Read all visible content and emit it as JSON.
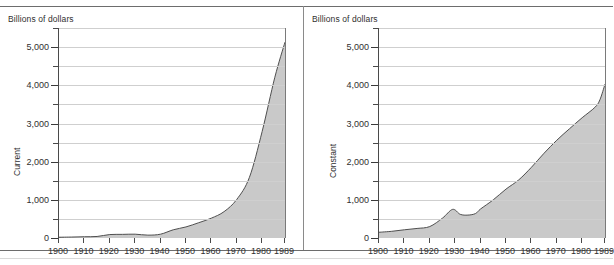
{
  "figure": {
    "unit_label": "Billions of dollars",
    "fill_color": "#c9c9c9",
    "stroke_color": "#4f4f4f",
    "grid_color": "#cfcfcf",
    "axis_color": "#4a4a4a"
  },
  "panels": [
    {
      "id": "left",
      "series_label": "Current"
    },
    {
      "id": "right",
      "series_label": "Constant"
    }
  ],
  "axis": {
    "y_labels": [
      "5,000",
      "4,000",
      "3,000",
      "2,000",
      "1,000",
      "0"
    ],
    "y_values": [
      5000,
      4000,
      3000,
      2000,
      1000,
      0
    ],
    "y_minor_values": [
      5500,
      4500,
      3500,
      2500,
      1500,
      500
    ],
    "x_labels": [
      "1900",
      "1910",
      "1920",
      "1930",
      "1940",
      "1950",
      "1960",
      "1970",
      "1980",
      "1989"
    ],
    "x_values": [
      1900,
      1910,
      1920,
      1930,
      1940,
      1950,
      1960,
      1970,
      1980,
      1989
    ]
  },
  "chart_data": [
    {
      "type": "area",
      "title": "",
      "subtitle": "",
      "panel": "Current",
      "xlabel": "",
      "ylabel": "Billions of dollars",
      "series_name": "Current",
      "xlim": [
        1900,
        1989
      ],
      "ylim": [
        0,
        5500
      ],
      "yticks": [
        0,
        1000,
        2000,
        3000,
        4000,
        5000
      ],
      "yticklabels": [
        "0",
        "1,000",
        "2,000",
        "3,000",
        "4,000",
        "5,000"
      ],
      "xticks": [
        1900,
        1910,
        1920,
        1930,
        1940,
        1950,
        1960,
        1970,
        1980,
        1989
      ],
      "grid": "horizontal",
      "legend": "none",
      "x": [
        1900,
        1905,
        1910,
        1915,
        1920,
        1925,
        1930,
        1935,
        1940,
        1945,
        1950,
        1955,
        1960,
        1965,
        1970,
        1975,
        1980,
        1985,
        1989
      ],
      "values": [
        20,
        25,
        33,
        40,
        90,
        95,
        100,
        75,
        100,
        215,
        290,
        400,
        520,
        690,
        1010,
        1590,
        2790,
        4210,
        5130
      ]
    },
    {
      "type": "area",
      "title": "",
      "subtitle": "",
      "panel": "Constant",
      "xlabel": "",
      "ylabel": "Billions of dollars",
      "series_name": "Constant",
      "xlim": [
        1900,
        1989
      ],
      "ylim": [
        0,
        5500
      ],
      "yticks": [
        0,
        1000,
        2000,
        3000,
        4000,
        5000
      ],
      "yticklabels": [
        "0",
        "1,000",
        "2,000",
        "3,000",
        "4,000",
        "5,000"
      ],
      "xticks": [
        1900,
        1910,
        1920,
        1930,
        1940,
        1950,
        1960,
        1970,
        1980,
        1989
      ],
      "grid": "horizontal",
      "legend": "none",
      "x": [
        1900,
        1905,
        1910,
        1915,
        1920,
        1925,
        1929,
        1932,
        1935,
        1938,
        1940,
        1945,
        1950,
        1955,
        1960,
        1965,
        1970,
        1975,
        1980,
        1985,
        1987,
        1989
      ],
      "values": [
        150,
        175,
        215,
        250,
        300,
        520,
        750,
        620,
        600,
        640,
        760,
        1000,
        1280,
        1520,
        1850,
        2220,
        2560,
        2860,
        3150,
        3420,
        3620,
        4030
      ]
    }
  ]
}
